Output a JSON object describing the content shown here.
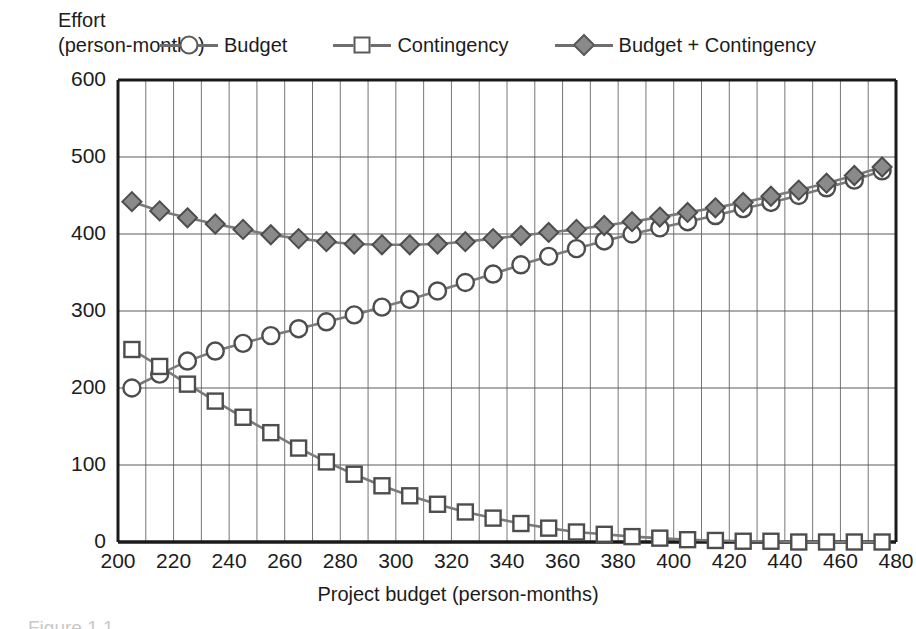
{
  "header": {
    "axis_title_line1": "Effort",
    "axis_title_line2": "(person-months)"
  },
  "legend": [
    {
      "label": "Budget",
      "marker": "circle-open-marker",
      "color": "#ffffff"
    },
    {
      "label": "Contingency",
      "marker": "square-open-marker",
      "color": "#ffffff"
    },
    {
      "label": "Budget + Contingency",
      "marker": "diamond-filled-marker",
      "color": "#8a8a8a"
    }
  ],
  "axes": {
    "xtitle": "Project budget (person-months)",
    "ytitle": "Effort (person-months)",
    "xticks": [
      200,
      220,
      240,
      260,
      280,
      300,
      320,
      340,
      360,
      380,
      400,
      420,
      440,
      460,
      480
    ],
    "yticks": [
      0,
      100,
      200,
      300,
      400,
      500,
      600
    ]
  },
  "caption": "Figure 1.1    ",
  "chart_data": {
    "type": "line",
    "title": "",
    "xlabel": "Project budget (person-months)",
    "ylabel": "Effort (person-months)",
    "xlim": [
      200,
      480
    ],
    "ylim": [
      0,
      600
    ],
    "grid": true,
    "legend_position": "top",
    "x": [
      205,
      215,
      225,
      235,
      245,
      255,
      265,
      275,
      285,
      295,
      305,
      315,
      325,
      335,
      345,
      355,
      365,
      375,
      385,
      395,
      405,
      415,
      425,
      435,
      445,
      455,
      465,
      475
    ],
    "series": [
      {
        "name": "Budget",
        "marker": "circle-open-marker",
        "values": [
          200,
          218,
          235,
          248,
          258,
          268,
          277,
          286,
          295,
          305,
          315,
          326,
          337,
          348,
          360,
          371,
          381,
          391,
          400,
          408,
          416,
          424,
          433,
          441,
          450,
          460,
          470,
          482
        ]
      },
      {
        "name": "Contingency",
        "marker": "square-open-marker",
        "values": [
          250,
          228,
          205,
          183,
          162,
          142,
          122,
          104,
          88,
          73,
          60,
          49,
          39,
          31,
          24,
          18,
          13,
          10,
          7,
          5,
          3,
          2,
          1,
          1,
          0,
          0,
          0,
          0
        ]
      },
      {
        "name": "Budget + Contingency",
        "marker": "diamond-filled-marker",
        "values": [
          442,
          430,
          421,
          413,
          406,
          399,
          394,
          390,
          387,
          386,
          386,
          387,
          390,
          394,
          398,
          402,
          406,
          411,
          416,
          422,
          428,
          434,
          441,
          449,
          457,
          466,
          476,
          487
        ]
      }
    ]
  }
}
